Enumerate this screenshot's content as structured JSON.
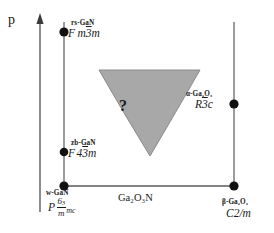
{
  "figure": {
    "type": "phase-diagram",
    "background_color": "#ffffff",
    "line_color": "#404040",
    "region_fill_color": "#a8a8a8",
    "region_edge_color": "#787878"
  },
  "axes": {
    "vertical": {
      "label": "p",
      "name": "pressure-axis",
      "has_arrow": true,
      "direction": "up"
    },
    "horizontal": {
      "label": "Ga₂O₃N",
      "name": "composition-axis",
      "has_arrow": false
    }
  },
  "phases": [
    {
      "id": "rs-gan",
      "name": "rs-GaN",
      "space_group_prefix": "F",
      "space_group_body": "m",
      "space_group_overline": "3",
      "space_group_suffix": "m",
      "space_group_plain": "F m3m",
      "position": "upper-left",
      "marker": "filled-circle"
    },
    {
      "id": "zb-gan",
      "name": "zb-GaN",
      "space_group_prefix": "F",
      "space_group_overline": "4",
      "space_group_body": "3",
      "space_group_suffix": "m",
      "space_group_plain": "F 43m",
      "position": "lower-left",
      "marker": "filled-circle"
    },
    {
      "id": "w-gan",
      "name": "w-GaN",
      "space_group_prefix": "P",
      "space_group_numerator": "6",
      "space_group_numerator_sub": "3",
      "space_group_denominator": "m",
      "space_group_suffix": "mc",
      "space_group_plain": "P 6₃/m mc",
      "position": "origin",
      "marker": "filled-circle"
    },
    {
      "id": "alpha-ga2o3",
      "name": "α-Ga₂O₃",
      "space_group_prefix": "R",
      "space_group_overline": "3",
      "space_group_suffix": "c",
      "space_group_plain": "R3c",
      "position": "middle-right",
      "marker": "filled-circle"
    },
    {
      "id": "beta-ga2o3",
      "name": "β-Ga₂O₃",
      "space_group_plain": "C2/m",
      "position": "lower-right",
      "marker": "filled-circle"
    }
  ],
  "unknown_region": {
    "name": "unknown-phase-region",
    "label": "?",
    "shape": "inverted-triangle-concave"
  }
}
